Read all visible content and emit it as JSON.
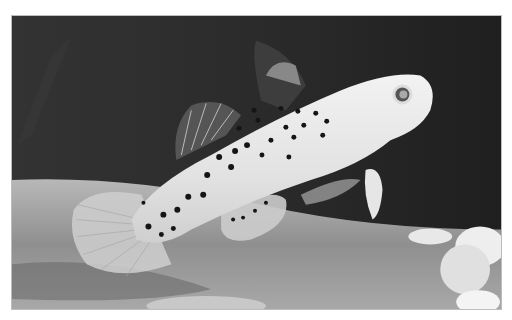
{
  "image": {
    "subject": "spotted fish",
    "style": "grayscale photograph",
    "colors": {
      "background_dark": "#2a2a2a",
      "substrate": "#9a9a9a",
      "fish_body": "#e6e6e6",
      "spots": "#151515",
      "pebbles": "#eeeeee"
    }
  }
}
